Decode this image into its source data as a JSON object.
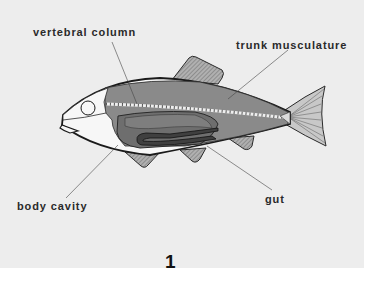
{
  "diagram": {
    "figure_number": "1",
    "labels": {
      "vertebral_column": "vertebral column",
      "trunk_musculature": "trunk musculature",
      "body_cavity": "body cavity",
      "gut": "gut"
    },
    "colors": {
      "background": "#ededed",
      "musculature": "#8a8a8a",
      "body_cavity": "#6e6e6e",
      "gut": "#3f3f3f",
      "fins": "#9a9a9a",
      "outline": "#1a1a1a"
    }
  }
}
